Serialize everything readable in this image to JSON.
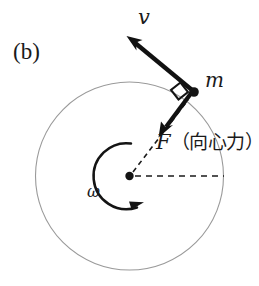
{
  "figure": {
    "panel_label": "(b)",
    "background_color": "#ffffff"
  },
  "labels": {
    "velocity": "v",
    "mass": "m",
    "force_symbol": "F",
    "force_name": "（向心力）",
    "angular_velocity": "ω"
  },
  "colors": {
    "circle_stroke": "#9a9a9a",
    "vector_stroke": "#111111",
    "dashed_stroke": "#1a1a1a",
    "text": "#1a1a1a"
  },
  "geometry": {
    "circle": {
      "cx": 129.5,
      "cy": 176,
      "r": 94,
      "stroke_width": 1.1
    },
    "center_dot": {
      "cx": 129.5,
      "cy": 176,
      "r": 4.2
    },
    "mass_point": {
      "cx": 194,
      "cy": 92,
      "r": 4.6
    },
    "velocity_vector": {
      "x1": 194,
      "y1": 92,
      "x2": 128,
      "y2": 37,
      "stroke_width": 4.2
    },
    "force_vector": {
      "x1": 194,
      "y1": 92,
      "x2": 160,
      "y2": 136,
      "stroke_width": 4.2
    },
    "radius_dashed": {
      "x1": 133,
      "y1": 172,
      "x2": 188,
      "y2": 100
    },
    "horizontal_dashed": {
      "x1": 135,
      "y1": 176,
      "x2": 224,
      "y2": 176
    },
    "right_angle_marker": {
      "size": 13
    },
    "omega_arc": {
      "cx": 129.5,
      "cy": 176,
      "r": 33,
      "start_deg": -88,
      "end_deg": 88
    }
  }
}
